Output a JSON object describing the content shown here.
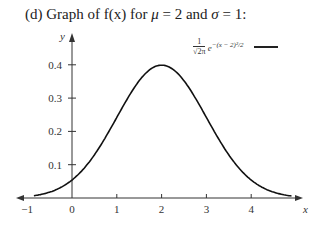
{
  "title": {
    "prefix": "(d)  Graph of f(x) for ",
    "mu_symbol": "μ",
    "mu_text": " = 2 and ",
    "sigma_symbol": "σ",
    "sigma_text": " = 1:"
  },
  "legend": {
    "numerator": "1",
    "denominator": "√2π",
    "base": "e",
    "exponent": "−(x − 2)²/2"
  },
  "chart_data": {
    "type": "line",
    "title": "(d) Graph of f(x) for μ = 2 and σ = 1:",
    "xlabel": "x",
    "ylabel": "y",
    "xlim": [
      -1,
      5
    ],
    "ylim": [
      0,
      0.45
    ],
    "x_ticks": [
      "-1",
      "0",
      "1",
      "2",
      "3",
      "4"
    ],
    "y_ticks": [
      "0.1",
      "0.2",
      "0.3",
      "0.4"
    ],
    "grid": false,
    "legend_position": "top-right",
    "series": [
      {
        "name": "1/√(2π) e^{−(x − 2)²/2}",
        "function": "normal pdf, mu=2, sigma=1",
        "x": [
          -1,
          -0.5,
          0,
          0.5,
          1,
          1.5,
          2,
          2.5,
          3,
          3.5,
          4,
          4.5,
          5
        ],
        "values": [
          0.004,
          0.018,
          0.054,
          0.13,
          0.242,
          0.352,
          0.399,
          0.352,
          0.242,
          0.13,
          0.054,
          0.018,
          0.004
        ]
      }
    ]
  }
}
